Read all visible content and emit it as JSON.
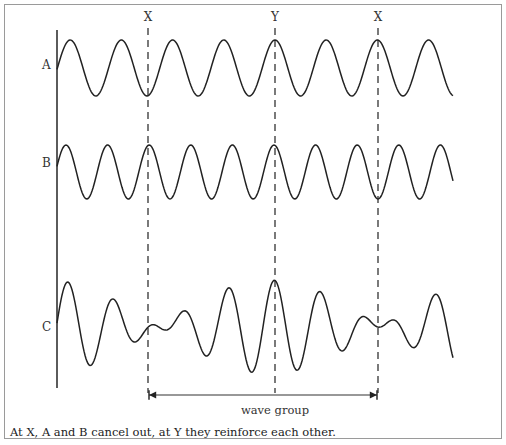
{
  "diagram": {
    "waves": [
      {
        "id": "A",
        "label": "A",
        "center_y": 68,
        "amplitude": 28,
        "period": 51.2,
        "peak_x": 275
      },
      {
        "id": "B",
        "label": "B",
        "center_y": 172,
        "amplitude": 27,
        "period": 41.6,
        "peak_x": 274
      },
      {
        "id": "C",
        "label": "C",
        "center_y": 327,
        "amplitude": 60,
        "description": "sum of A and B (beat pattern)"
      }
    ],
    "markers": [
      {
        "label": "X",
        "x": 148
      },
      {
        "label": "Y",
        "x": 275
      },
      {
        "label": "X",
        "x": 378
      }
    ],
    "axis": {
      "x": 57,
      "y_top": 30,
      "y_bottom": 388
    },
    "wave_x_range": [
      57,
      453
    ],
    "wave_group": {
      "label": "wave group",
      "from_x": 148,
      "to_x": 378,
      "y": 395
    },
    "caption": "At X, A and B cancel out, at Y they reinforce each other.",
    "colors": {
      "line": "#222222",
      "border": "#9a9a9a",
      "background": "#ffffff"
    }
  }
}
